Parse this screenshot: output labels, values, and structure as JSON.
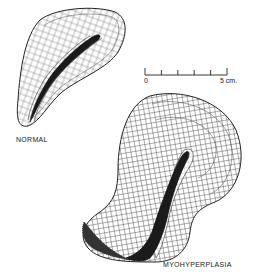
{
  "figure": {
    "panels": [
      {
        "id": "normal",
        "label": "NORMAL"
      },
      {
        "id": "myohyperplasia",
        "label": "MYOHYPERPLASIA"
      }
    ],
    "scale_bar": {
      "start_label": "0",
      "end_label": "5 cm.",
      "ticks": 6
    },
    "colors": {
      "ink": "#222222",
      "background": "#ffffff"
    }
  }
}
